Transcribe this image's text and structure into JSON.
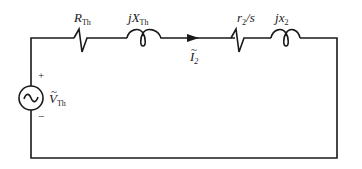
{
  "diagram": {
    "type": "equivalent-circuit",
    "wire_color": "#1a1a1a",
    "background": "#ffffff",
    "components": [
      {
        "id": "source",
        "kind": "ac-voltage-source",
        "symbol": "~",
        "label_main": "V",
        "label_sub": "Th",
        "tilde": "~",
        "plus": "+",
        "minus": "−"
      },
      {
        "id": "r_th",
        "kind": "resistor",
        "label_main": "R",
        "label_sub": "Th"
      },
      {
        "id": "x_th",
        "kind": "inductor",
        "label_prefix": "j",
        "label_main": "X",
        "label_sub": "Th"
      },
      {
        "id": "current",
        "kind": "current-arrow",
        "label_main": "I",
        "label_sub": "2",
        "tilde": "~"
      },
      {
        "id": "r2_s",
        "kind": "resistor",
        "label_main": "r",
        "label_sub": "2",
        "label_suffix": "/s"
      },
      {
        "id": "x2",
        "kind": "inductor",
        "label_prefix": "j",
        "label_main": "x",
        "label_sub": "2"
      }
    ]
  }
}
